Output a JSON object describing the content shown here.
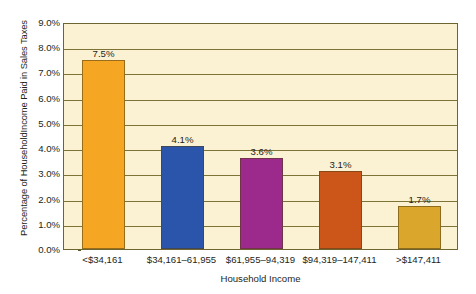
{
  "chart_data": {
    "type": "bar",
    "title": "",
    "xlabel": "Household Income",
    "ylabel": "Percentage of HouseholdIncome Paid in Sales Taxes",
    "categories": [
      "<$34,161",
      "$34,161–61,955",
      "$61,955–94,319",
      "$94,319–147,411",
      ">$147,411"
    ],
    "values": [
      7.5,
      4.1,
      3.6,
      3.1,
      1.7
    ],
    "value_labels": [
      "7.5%",
      "4.1%",
      "3.6%",
      "3.1%",
      "1.7%"
    ],
    "ylim": [
      0.0,
      9.0
    ],
    "ytick_values": [
      0.0,
      1.0,
      2.0,
      3.0,
      4.0,
      5.0,
      6.0,
      7.0,
      8.0,
      9.0
    ],
    "ytick_labels": [
      "0.0%",
      "1.0%",
      "2.0%",
      "3.0%",
      "4.0%",
      "5.0%",
      "6.0%",
      "7.0%",
      "8.0%",
      "9.0%"
    ],
    "grid": true,
    "legend": false,
    "legend_position": "none",
    "bar_colors": [
      "#f5a623",
      "#2a55aa",
      "#9c2a8c",
      "#cc5519",
      "#daa62c"
    ],
    "plot_background": "#fbf2d4",
    "gridline_color": "#7d7336",
    "axis_border_color": "#6e6530",
    "text_color": "#231f20"
  }
}
